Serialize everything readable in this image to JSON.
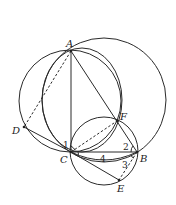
{
  "figure": {
    "type": "geometry-diagram",
    "points": [
      {
        "label": "A",
        "x": 71,
        "y": 51
      },
      {
        "label": "B",
        "x": 137,
        "y": 152
      },
      {
        "label": "C",
        "x": 71,
        "y": 152
      },
      {
        "label": "D",
        "x": 24,
        "y": 127
      },
      {
        "label": "E",
        "x": 119,
        "y": 180
      },
      {
        "label": "F",
        "x": 117,
        "y": 121
      }
    ],
    "angle_labels": [
      "1",
      "2",
      "3",
      "4"
    ],
    "circles": [
      {
        "name": "circle-ABF",
        "cx": 104,
        "cy": 100,
        "r": 62
      },
      {
        "name": "circle-ADC",
        "cx": 70,
        "cy": 101,
        "r": 51
      },
      {
        "name": "circle-ACF",
        "cx": 82,
        "cy": 100,
        "r": 40
      },
      {
        "name": "circle-CFBE",
        "cx": 104,
        "cy": 151,
        "r": 34
      }
    ],
    "solid_segments": [
      "AC",
      "AB",
      "CB",
      "DC",
      "CE",
      "FB"
    ],
    "dashed_segments": [
      "AD",
      "CF",
      "BE"
    ]
  },
  "labels": {
    "A": "A",
    "B": "B",
    "C": "C",
    "D": "D",
    "E": "E",
    "F": "F",
    "angle1": "1",
    "angle2": "2",
    "angle3": "3",
    "angle4": "4"
  }
}
